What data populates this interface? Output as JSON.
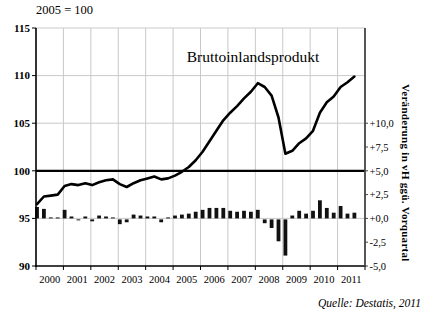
{
  "colors": {
    "background": "#ffffff",
    "grid": "#c9c9c9",
    "axis": "#000000",
    "right_axis": "#444444",
    "reference_line": "#000000",
    "line_series": "#000000",
    "bar_series": "#111111",
    "text": "#000000"
  },
  "chart_data": {
    "type": "line+bar combo",
    "title": "Bruttoinlandsprodukt",
    "index_note": "2005 = 100",
    "source": "Quelle: Destatis, 2011",
    "x_axis": {
      "year_labels": [
        "2000",
        "2001",
        "2002",
        "2003",
        "2004",
        "2005",
        "2006",
        "2007",
        "2008",
        "2009",
        "2010",
        "2011"
      ],
      "frequency": "quarterly",
      "start": "2000 Q1",
      "end": "2011 Q3"
    },
    "left_axis": {
      "range": [
        90,
        115
      ],
      "ticks": [
        115,
        110,
        105,
        100,
        95,
        90
      ],
      "reference_line_value": 100,
      "grid_values": [
        115,
        110,
        105,
        95
      ]
    },
    "right_axis": {
      "label": "Veränderung in vH ggü. Vorquartal",
      "tick_labels": [
        "+10,0",
        "+7,5",
        "+5,0",
        "+2,5",
        "+0,0",
        "-2,5",
        "-5,0"
      ],
      "tick_values": [
        10,
        7.5,
        5,
        2.5,
        0,
        -2.5,
        -5
      ],
      "zero_at_left_value": 95
    },
    "series": [
      {
        "name": "Bruttoinlandsprodukt (Index, 2005 = 100)",
        "type": "line",
        "values": [
          96.5,
          97.3,
          97.4,
          97.5,
          98.4,
          98.6,
          98.5,
          98.7,
          98.5,
          98.8,
          99.0,
          99.1,
          98.6,
          98.3,
          98.7,
          99.0,
          99.2,
          99.4,
          99.1,
          99.2,
          99.5,
          99.9,
          100.4,
          101.1,
          102.0,
          103.1,
          104.2,
          105.3,
          106.1,
          106.8,
          107.6,
          108.3,
          109.2,
          108.8,
          107.9,
          105.6,
          101.8,
          102.1,
          102.9,
          103.4,
          104.2,
          106.1,
          107.2,
          107.8,
          108.8,
          109.3,
          109.9
        ]
      },
      {
        "name": "Veränderung in vH ggü. Vorquartal",
        "type": "bar",
        "values": [
          1.2,
          1.0,
          0.1,
          0.1,
          0.9,
          0.2,
          -0.1,
          0.2,
          -0.2,
          0.3,
          0.2,
          0.1,
          -0.5,
          -0.3,
          0.4,
          0.3,
          0.2,
          0.2,
          -0.3,
          0.1,
          0.3,
          0.4,
          0.5,
          0.7,
          0.9,
          1.1,
          1.1,
          1.1,
          0.8,
          0.7,
          0.8,
          0.7,
          0.9,
          -0.4,
          -0.9,
          -2.3,
          -3.8,
          0.3,
          0.8,
          0.5,
          0.8,
          1.9,
          1.1,
          0.6,
          1.3,
          0.5,
          0.6
        ]
      }
    ],
    "layout": {
      "plot": {
        "x0": 36,
        "y0": 28,
        "x1": 365,
        "y1": 266
      },
      "legend": "none",
      "grid": "on"
    }
  }
}
